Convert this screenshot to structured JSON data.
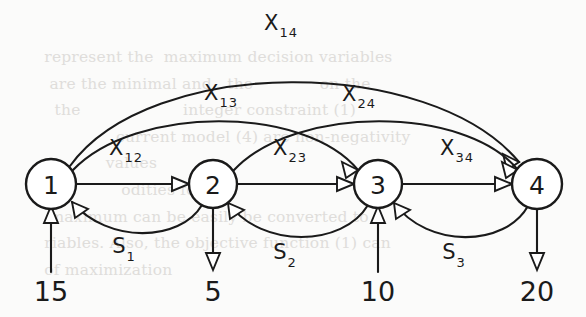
{
  "diagram": {
    "background_color": "#fbfbfa",
    "ink_color": "#1a1a1a",
    "nodes": [
      {
        "id": "1",
        "label": "1",
        "cx": 51,
        "cy": 184,
        "r": 25
      },
      {
        "id": "2",
        "label": "2",
        "cx": 213,
        "cy": 184,
        "r": 24
      },
      {
        "id": "3",
        "label": "3",
        "cx": 378,
        "cy": 184,
        "r": 24
      },
      {
        "id": "4",
        "label": "4",
        "cx": 537,
        "cy": 184,
        "r": 25
      }
    ],
    "flow_edges": [
      {
        "id": "x12",
        "from": "1",
        "to": "2",
        "base": "X",
        "sub": "12",
        "label_x": 130,
        "label_y": 150
      },
      {
        "id": "x23",
        "from": "2",
        "to": "3",
        "base": "X",
        "sub": "23",
        "label_x": 294,
        "label_y": 150
      },
      {
        "id": "x34",
        "from": "3",
        "to": "4",
        "base": "X",
        "sub": "34",
        "label_x": 460,
        "label_y": 150
      },
      {
        "id": "x13",
        "from": "1",
        "to": "3",
        "base": "X",
        "sub": "13",
        "label_x": 225,
        "label_y": 100
      },
      {
        "id": "x24",
        "from": "2",
        "to": "4",
        "base": "X",
        "sub": "24",
        "label_x": 360,
        "label_y": 100
      },
      {
        "id": "x14",
        "from": "1",
        "to": "4",
        "base": "X",
        "sub": "14",
        "label_x": 281,
        "label_y": 30
      }
    ],
    "return_edges": [
      {
        "id": "s1",
        "from": "2",
        "to": "1",
        "base": "S",
        "sub": "1",
        "label_x": 127,
        "label_y": 253
      },
      {
        "id": "s2",
        "from": "3",
        "to": "2",
        "base": "S",
        "sub": "2",
        "label_x": 288,
        "label_y": 258
      },
      {
        "id": "s3",
        "from": "4",
        "to": "3",
        "base": "S",
        "sub": "3",
        "label_x": 457,
        "label_y": 258
      }
    ],
    "supplies": [
      {
        "node": "1",
        "value": "15",
        "direction": "in",
        "x": 51,
        "y": 299
      },
      {
        "node": "2",
        "value": "5",
        "direction": "out",
        "x": 213,
        "y": 299
      },
      {
        "node": "3",
        "value": "10",
        "direction": "in",
        "x": 378,
        "y": 299
      },
      {
        "node": "4",
        "value": "20",
        "direction": "out",
        "x": 537,
        "y": 299
      }
    ],
    "ghost_text": "  represent the  maximum decision variables \n   are the minimal and   the             on the \n    the                    integer constraint (1)\n                current model (4) are non-negativity \n              values                                \n                 odities for                  \n   maximum can be easily be converted to\n  riables. Also, the objective function (1) can\n  of maximization"
  }
}
